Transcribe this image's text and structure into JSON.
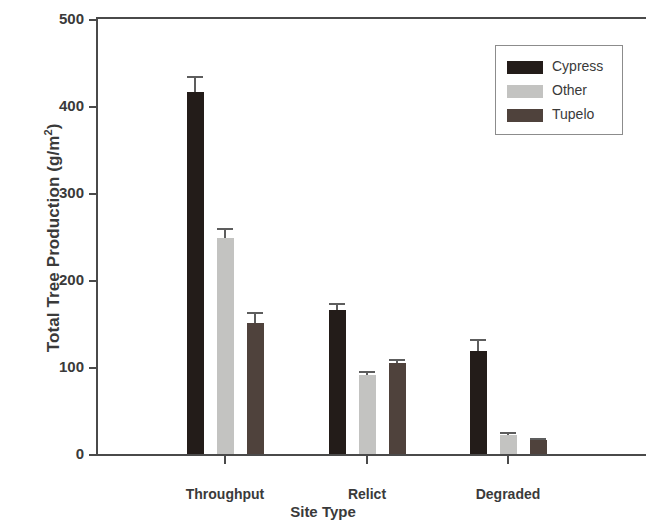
{
  "chart_data": {
    "type": "bar",
    "title": "",
    "xlabel": "Site Type",
    "ylabel": "Total Tree Production (g/m",
    "ylabel_sup": "2",
    "ylabel_suffix": ")",
    "categories": [
      "Throughput",
      "Relict",
      "Degraded"
    ],
    "ylim": [
      0,
      500
    ],
    "yticks": [
      0,
      100,
      200,
      300,
      400,
      500
    ],
    "ytick_labels": [
      "0",
      "100",
      "200",
      "300",
      "400",
      "500"
    ],
    "grid": false,
    "legend_position": "top-right",
    "series": [
      {
        "name": "Cypress",
        "color": "#231c19",
        "values": [
          416,
          165,
          118
        ],
        "errors": [
          19,
          8,
          14
        ]
      },
      {
        "name": "Other",
        "color": "#c3c3c1",
        "values": [
          248,
          91,
          22
        ],
        "errors": [
          12,
          4,
          3
        ]
      },
      {
        "name": "Tupelo",
        "color": "#4f423c",
        "values": [
          151,
          105,
          16
        ],
        "errors": [
          12,
          4,
          2
        ]
      }
    ]
  },
  "legend": {
    "items": [
      {
        "label": "Cypress"
      },
      {
        "label": "Other"
      },
      {
        "label": "Tupelo"
      }
    ]
  }
}
